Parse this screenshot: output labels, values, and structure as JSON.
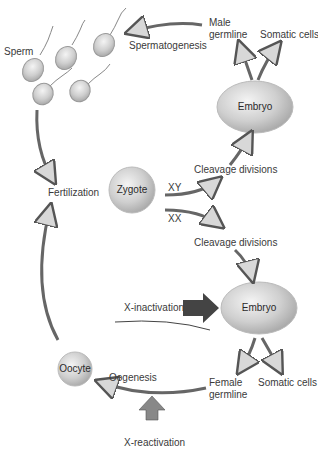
{
  "diagram": {
    "type": "life-cycle",
    "nodes": {
      "sperm": "Sperm",
      "zygote": "Zygote",
      "embryo_male": "Embryo",
      "embryo_female": "Embryo",
      "oocyte": "Oocyte",
      "male_germline": [
        "Male",
        "germline"
      ],
      "female_germline": [
        "Female",
        "germline"
      ],
      "somatic_male": "Somatic cells",
      "somatic_female": "Somatic cells"
    },
    "processes": {
      "spermatogenesis": "Spermatogenesis",
      "fertilization": "Fertilization",
      "cleavage_xy": "Cleavage divisions",
      "cleavage_xx": "Cleavage divisions",
      "oogenesis": "Oogenesis",
      "x_inactivation": "X-inactivation",
      "x_reactivation": "X-reactivation"
    },
    "branches": {
      "male": "XY",
      "female": "XX"
    },
    "colors": {
      "cell_fill": "#c9c9c9",
      "cell_highlight": "#f0f0f0",
      "arrow_fill": "#d6d6d6",
      "arrow_stroke": "#555555",
      "dark_arrow": "#444444",
      "text": "#333333"
    }
  }
}
